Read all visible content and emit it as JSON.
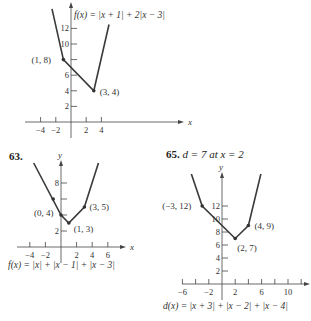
{
  "problems": [
    {
      "number": "",
      "formula": "f(x) = |x + 1| + 2|x − 3|"
    },
    {
      "number": "63.",
      "formula": "f(x) = |x| + |x − 1| + |x − 3|"
    },
    {
      "number": "65.",
      "note": "d = 7 at x = 2",
      "formula": "d(x) = |x + 3| + |x − 2| + |x − 4|"
    }
  ],
  "chart_data": [
    {
      "type": "line",
      "title": "f(x) = |x + 1| + 2|x − 3|",
      "xlabel": "x",
      "ylabel": "y",
      "x_ticks": [
        -4,
        -2,
        2,
        4
      ],
      "y_ticks": [
        2,
        4,
        6,
        8,
        10,
        12
      ],
      "y_tick_labels": [
        "2",
        "4",
        "6",
        "",
        "10",
        "12"
      ],
      "points": [
        [
          -2.5,
          14.5
        ],
        [
          -1,
          8
        ],
        [
          3,
          4
        ],
        [
          5,
          12.5
        ]
      ],
      "labeled_points": [
        {
          "label": "(1, 8)",
          "x": -1,
          "y": 8
        },
        {
          "label": "(3, 4)",
          "x": 3,
          "y": 4
        }
      ],
      "grid": false
    },
    {
      "type": "line",
      "title": "f(x) = |x| + |x − 1| + |x − 3|",
      "xlabel": "x",
      "ylabel": "y",
      "x_ticks": [
        -4,
        -2,
        2,
        4,
        6
      ],
      "y_ticks": [
        2,
        4,
        6,
        8
      ],
      "y_tick_labels": [
        "2",
        "",
        "",
        "8"
      ],
      "points": [
        [
          -3.5,
          10.5
        ],
        [
          0,
          4
        ],
        [
          1,
          3
        ],
        [
          3,
          5
        ],
        [
          4.8,
          10.5
        ]
      ],
      "labeled_points": [
        {
          "label": "(0, 4)",
          "x": 0,
          "y": 4
        },
        {
          "label": "(1, 3)",
          "x": 1,
          "y": 3
        },
        {
          "label": "(3, 5)",
          "x": 3,
          "y": 5
        },
        {
          "label": "",
          "x": -1,
          "y": 6
        }
      ],
      "grid": false
    },
    {
      "type": "line",
      "title": "d(x) = |x + 3| + |x − 2| + |x − 4|",
      "xlabel": "x",
      "ylabel": "y",
      "x_ticks": [
        -6,
        -4,
        -2,
        2,
        4,
        6,
        8,
        10,
        12
      ],
      "x_tick_labels": [
        "−6",
        "",
        "−2",
        "2",
        "",
        "6",
        "",
        "10",
        ""
      ],
      "y_ticks": [
        2,
        4,
        6,
        8,
        10,
        12
      ],
      "points": [
        [
          -5.5,
          19.5
        ],
        [
          -3,
          12
        ],
        [
          2,
          7
        ],
        [
          4,
          9
        ],
        [
          6.5,
          19.5
        ]
      ],
      "labeled_points": [
        {
          "label": "(−3, 12)",
          "x": -3,
          "y": 12
        },
        {
          "label": "(2, 7)",
          "x": 2,
          "y": 7
        },
        {
          "label": "(4, 9)",
          "x": 4,
          "y": 9
        }
      ],
      "grid": false
    }
  ]
}
